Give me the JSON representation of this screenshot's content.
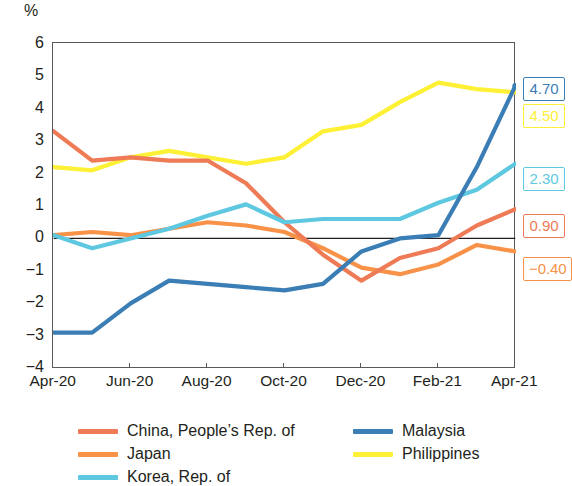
{
  "unit_label": "%",
  "axes": {
    "y_ticks": [
      "6",
      "5",
      "4",
      "3",
      "2",
      "1",
      "0",
      "−1",
      "−2",
      "−3",
      "−4"
    ],
    "x_ticks": [
      "Apr-20",
      "Jun-20",
      "Aug-20",
      "Oct-20",
      "Dec-20",
      "Feb-21",
      "Apr-21"
    ]
  },
  "legend": {
    "items": [
      {
        "label": "China, People’s Rep. of",
        "color": "#ef7b56"
      },
      {
        "label": "Japan",
        "color": "#f79248"
      },
      {
        "label": "Korea, Rep. of",
        "color": "#5ec8e0"
      },
      {
        "label": "Malaysia",
        "color": "#3a7eb5"
      },
      {
        "label": "Philippines",
        "color": "#fdf035"
      }
    ]
  },
  "end_labels": [
    {
      "text": "4.70",
      "color": "#3a7eb5",
      "series": "Malaysia"
    },
    {
      "text": "4.50",
      "color": "#fdf035",
      "series": "Philippines"
    },
    {
      "text": "2.30",
      "color": "#5ec8e0",
      "series": "Korea, Rep. of"
    },
    {
      "text": "0.90",
      "color": "#ef7b56",
      "series": "China, People’s Rep. of"
    },
    {
      "text": "−0.40",
      "color": "#f79248",
      "series": "Japan"
    }
  ],
  "chart_data": {
    "type": "line",
    "title": "",
    "subtitle": "",
    "xlabel": "",
    "ylabel": "%",
    "ylim": [
      -4,
      6
    ],
    "y_tick_values": [
      6,
      5,
      4,
      3,
      2,
      1,
      0,
      -1,
      -2,
      -3,
      -4
    ],
    "grid": false,
    "zero_line": true,
    "legend_position": "bottom",
    "x": [
      "Apr-20",
      "May-20",
      "Jun-20",
      "Jul-20",
      "Aug-20",
      "Sep-20",
      "Oct-20",
      "Nov-20",
      "Dec-20",
      "Jan-21",
      "Feb-21",
      "Mar-21",
      "Apr-21"
    ],
    "x_tick_labels": [
      "Apr-20",
      "Jun-20",
      "Aug-20",
      "Oct-20",
      "Dec-20",
      "Feb-21",
      "Apr-21"
    ],
    "x_tick_indices": [
      0,
      2,
      4,
      6,
      8,
      10,
      12
    ],
    "series": [
      {
        "name": "China, People’s Rep. of",
        "color": "#ef7b56",
        "end_value": 0.9,
        "values": [
          3.3,
          2.4,
          2.5,
          2.4,
          2.4,
          1.7,
          0.5,
          -0.5,
          -1.3,
          -0.6,
          -0.3,
          0.4,
          0.9
        ]
      },
      {
        "name": "Japan",
        "color": "#f79248",
        "end_value": -0.4,
        "values": [
          0.1,
          0.2,
          0.1,
          0.3,
          0.5,
          0.4,
          0.2,
          -0.3,
          -0.9,
          -1.1,
          -0.8,
          -0.2,
          -0.4
        ]
      },
      {
        "name": "Korea, Rep. of",
        "color": "#5ec8e0",
        "end_value": 2.3,
        "values": [
          0.1,
          -0.3,
          0.0,
          0.3,
          0.7,
          1.05,
          0.5,
          0.6,
          0.6,
          0.6,
          1.1,
          1.5,
          2.3
        ]
      },
      {
        "name": "Malaysia",
        "color": "#3a7eb5",
        "end_value": 4.7,
        "values": [
          -2.9,
          -2.9,
          -2.0,
          -1.3,
          -1.4,
          -1.5,
          -1.6,
          -1.4,
          -0.4,
          0.0,
          0.1,
          2.2,
          4.7
        ]
      },
      {
        "name": "Philippines",
        "color": "#fdf035",
        "end_value": 4.5,
        "values": [
          2.2,
          2.1,
          2.5,
          2.7,
          2.5,
          2.3,
          2.5,
          3.3,
          3.5,
          4.2,
          4.8,
          4.6,
          4.5
        ]
      }
    ]
  }
}
